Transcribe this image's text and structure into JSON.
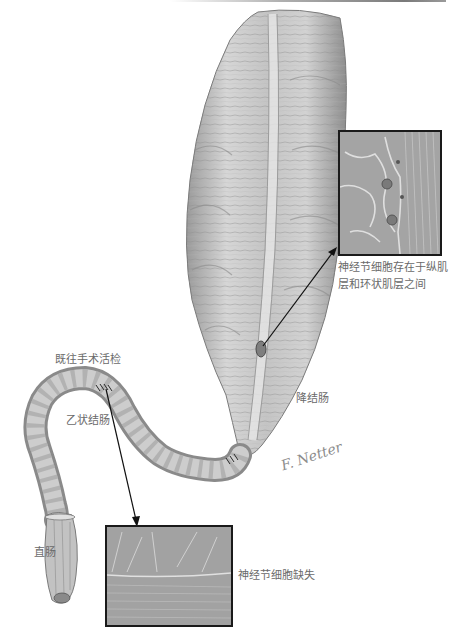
{
  "figure": {
    "style": "grayscale anatomical illustration"
  },
  "labels": {
    "ganglion_present": [
      "神经节细胞存在于纵肌",
      "层和环状肌层之间"
    ],
    "prior_biopsy": "既往手术活检",
    "descending_colon": "降结肠",
    "sigmoid_colon": "乙状结肠",
    "rectum": "直肠",
    "ganglion_absent": "神经节细胞缺失"
  },
  "insets": {
    "top": {
      "description": "histology with ganglion cells between muscle layers",
      "border_color": "#1a1a1a"
    },
    "bottom": {
      "description": "histology lacking ganglion cells",
      "border_color": "#1a1a1a"
    }
  },
  "signature": "F. Netter",
  "colors": {
    "label_text": "#6a6a6a",
    "arrow": "#111111",
    "tissue_light": "#d8d8d8",
    "tissue_dark": "#8a8a8a"
  }
}
